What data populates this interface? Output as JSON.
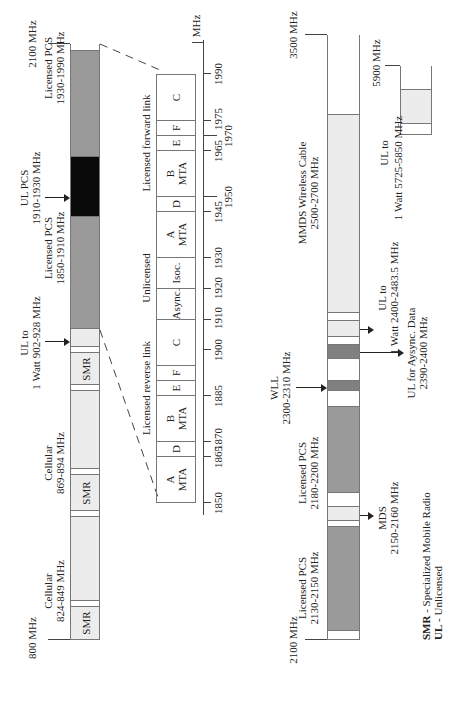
{
  "left_band": {
    "start_label": "800 MHz",
    "end_label": "2100 MHz",
    "segments": [
      {
        "name": "SMR",
        "label": "SMR"
      },
      {
        "name": "cellular-1",
        "title": "Cellular",
        "range": "824-849 MHz"
      },
      {
        "name": "SMR",
        "label": "SMR"
      },
      {
        "name": "cellular-2",
        "title": "Cellular",
        "range": "869-894 MHz"
      },
      {
        "name": "SMR",
        "label": "SMR"
      },
      {
        "name": "ul-900",
        "title": "UL to",
        "range": "1 Watt 902-928 MHz"
      },
      {
        "name": "licensed-pcs-1",
        "title": "Licensed PCS",
        "range": "1850-1910 MHz"
      },
      {
        "name": "ul-pcs",
        "title": "UL PCS",
        "range": "1910-1930 MHz"
      },
      {
        "name": "licensed-pcs-2",
        "title": "Licensed PCS",
        "range": "1930-1990 MHz"
      }
    ]
  },
  "detail": {
    "group_labels": {
      "reverse": "Licensed reverse link",
      "unlicensed": "Unlicensed",
      "forward": "Licensed forward link"
    },
    "blocks": [
      {
        "label": "A",
        "sub": "MTA"
      },
      {
        "label": "D",
        "sub": ""
      },
      {
        "label": "B",
        "sub": "MTA"
      },
      {
        "label": "E",
        "sub": ""
      },
      {
        "label": "F",
        "sub": ""
      },
      {
        "label": "C",
        "sub": ""
      },
      {
        "label": "Async.",
        "sub": ""
      },
      {
        "label": "Isoc.",
        "sub": ""
      },
      {
        "label": "A",
        "sub": "MTA"
      },
      {
        "label": "D",
        "sub": ""
      },
      {
        "label": "B",
        "sub": "MTA"
      },
      {
        "label": "E",
        "sub": ""
      },
      {
        "label": "F",
        "sub": ""
      },
      {
        "label": "C",
        "sub": ""
      }
    ],
    "ticks_row1": [
      "1850",
      "1865",
      "1870",
      "1885",
      "1900",
      "1910",
      "1920",
      "1930",
      "1945",
      "1965",
      "1975",
      "1990"
    ],
    "ticks_row2": [
      "1950",
      "1970"
    ],
    "unit": "MHz"
  },
  "right_band": {
    "start_label": "2100 MHz",
    "end_label": "3500 MHz",
    "segments": [
      {
        "name": "licensed-pcs-3",
        "title": "Licensed PCS",
        "range": "2130-2150 MHz"
      },
      {
        "name": "mds",
        "title": "MDS",
        "range": "2150-2160 MHz"
      },
      {
        "name": "licensed-pcs-4",
        "title": "Licensed PCS",
        "range": "2180-2200 MHz"
      },
      {
        "name": "wll",
        "title": "WLL",
        "range": "2300-2310 MHz"
      },
      {
        "name": "ul-async",
        "title": "UL for Aysync. Data",
        "range": "2390-2400 MHz"
      },
      {
        "name": "ul-2400",
        "title": "UL to",
        "range": "1 Watt 2400-2483.5 MHz"
      },
      {
        "name": "mmds",
        "title": "MMDS Wireless Cable",
        "range": "2500-2700 MHz"
      }
    ]
  },
  "small_band": {
    "end_label": "5900 MHz",
    "title": "UL to",
    "range": "1 Watt 5725-5850 MHz"
  },
  "legend": {
    "smr_key": "SMR",
    "smr_desc": " - Specialized Mobile Radio",
    "ul_key": "UL",
    "ul_desc": " - Unlicensed"
  },
  "colors": {
    "light": "#ececec",
    "medium": "#9a9a9a",
    "dark": "#808080",
    "black": "#0a0a0a",
    "white": "#ffffff"
  }
}
